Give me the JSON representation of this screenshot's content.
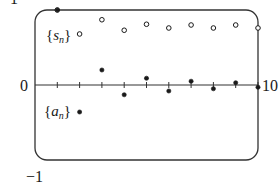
{
  "chart_data": {
    "type": "scatter",
    "title": "",
    "xlabel": "",
    "ylabel": "",
    "xlim": [
      0,
      10
    ],
    "ylim": [
      -1,
      1
    ],
    "grid": false,
    "x_tick_labels": [
      "10"
    ],
    "y_tick_labels": [
      "1",
      "0",
      "-1"
    ],
    "x_ticks": [
      1,
      2,
      3,
      4,
      5,
      6,
      7,
      8,
      9,
      10
    ],
    "series": [
      {
        "name": "{s_n}",
        "marker": "open-circle",
        "x": [
          1,
          2,
          3,
          4,
          5,
          6,
          7,
          8,
          9,
          10
        ],
        "values": [
          1.0,
          0.68,
          0.87,
          0.73,
          0.81,
          0.76,
          0.8,
          0.76,
          0.8,
          0.76
        ]
      },
      {
        "name": "{a_n}",
        "marker": "filled-dot",
        "x": [
          1,
          2,
          3,
          4,
          5,
          6,
          7,
          8,
          9,
          10
        ],
        "values": [
          1.0,
          -0.36,
          0.2,
          -0.13,
          0.09,
          -0.08,
          0.05,
          -0.05,
          0.03,
          -0.03
        ]
      }
    ],
    "annotations": [
      {
        "text": "{s_n}",
        "near_series": "{s_n}"
      },
      {
        "text": "{a_n}",
        "near_series": "{a_n}"
      }
    ]
  },
  "labels": {
    "y_top": "1",
    "y_zero": "0",
    "y_bottom": "−1",
    "x_right": "10",
    "s_label_open": "{",
    "s_label_var": "s",
    "s_label_sub": "n",
    "s_label_close": "}",
    "a_label_open": "{",
    "a_label_var": "a",
    "a_label_sub": "n",
    "a_label_close": "}"
  },
  "style": {
    "ink": "#1a1a1a",
    "frame": "#333333",
    "background": "#ffffff"
  }
}
